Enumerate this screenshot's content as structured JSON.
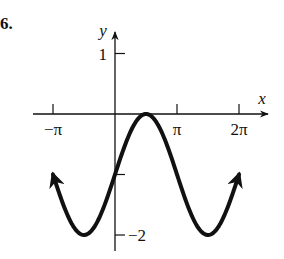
{
  "problem_number": "6.",
  "chart_data": {
    "type": "line",
    "title": "",
    "function": "y = sin(x) - 1",
    "xlabel": "x",
    "ylabel": "y",
    "x_ticks": [
      {
        "value": -3.14159,
        "label": "−π"
      },
      {
        "value": 3.14159,
        "label": "π"
      },
      {
        "value": 6.28319,
        "label": "2π"
      }
    ],
    "y_ticks": [
      {
        "value": 1,
        "label": "1"
      },
      {
        "value": -1,
        "label": ""
      },
      {
        "value": -2,
        "label": "−2"
      }
    ],
    "xlim": [
      -3.14159,
      6.28319
    ],
    "ylim": [
      -2,
      1
    ],
    "grid": false,
    "legend": null,
    "series": [
      {
        "name": "curve",
        "x": [
          -3.14159,
          -2.35619,
          -1.5708,
          -0.7854,
          0,
          0.7854,
          1.5708,
          2.35619,
          3.14159,
          3.92699,
          4.71239,
          5.49779,
          6.28319
        ],
        "y": [
          -1,
          -1.707,
          -2,
          -1.707,
          -1,
          -0.293,
          0,
          -0.293,
          -1,
          -1.707,
          -2,
          -1.707,
          -1
        ],
        "arrows": [
          "start",
          "end"
        ]
      }
    ]
  }
}
